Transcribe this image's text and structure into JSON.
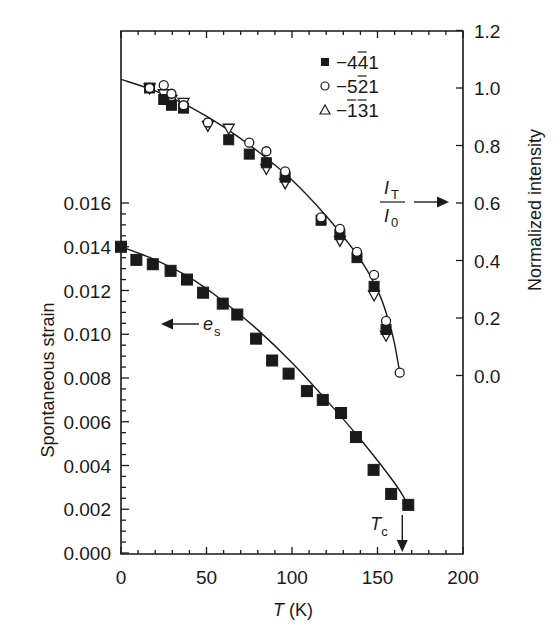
{
  "chart_data": {
    "type": "scatter",
    "title": "",
    "xlabel": "T (K)",
    "xlabel_parts": {
      "var": "T",
      "unit": " (K)"
    },
    "ylabel_left": "Spontaneous strain",
    "ylabel_right": "Normalized intensity",
    "xlim": [
      0,
      200
    ],
    "ylim_left": [
      0,
      0.016
    ],
    "ylim_right": [
      0.0,
      1.2
    ],
    "x_ticks": [
      0,
      50,
      100,
      150,
      200
    ],
    "x_tick_labels": [
      "0",
      "50",
      "100",
      "150",
      "200"
    ],
    "y_left_ticks": [
      0,
      0.002,
      0.004,
      0.006,
      0.008,
      0.01,
      0.012,
      0.014,
      0.016
    ],
    "y_left_tick_labels": [
      "0.000",
      "0.002",
      "0.004",
      "0.006",
      "0.008",
      "0.010",
      "0.012",
      "0.014",
      "0.016"
    ],
    "y_right_ticks": [
      0.0,
      0.2,
      0.4,
      0.6,
      0.8,
      1.0,
      1.2
    ],
    "y_right_tick_labels": [
      "0.0",
      "0.2",
      "0.4",
      "0.6",
      "0.8",
      "1.0",
      "1.2"
    ],
    "grid": false,
    "legend_position": "upper right (inside)",
    "legend": [
      {
        "marker": "filled-square",
        "label": "−441",
        "overbar_index": 2
      },
      {
        "marker": "open-circle",
        "label": "−521",
        "overbar_index": 2
      },
      {
        "marker": "open-triangle",
        "label": "−131",
        "overbar_index": [
          1,
          2
        ]
      }
    ],
    "series": [
      {
        "name": "−4 4̄ 1 (normalized intensity)",
        "axis": "right",
        "marker": "filled-square",
        "x": [
          16.7,
          25,
          29.5,
          36.6,
          63,
          75,
          85,
          96,
          117,
          128,
          138,
          148,
          155
        ],
        "y": [
          1.0,
          0.96,
          0.94,
          0.93,
          0.82,
          0.77,
          0.74,
          0.69,
          0.54,
          0.49,
          0.41,
          0.31,
          0.16
        ]
      },
      {
        "name": "−5 2̄ 1 (normalized intensity)",
        "axis": "right",
        "marker": "open-circle",
        "x": [
          16.7,
          25,
          29.5,
          36.6,
          50.8,
          75,
          85,
          96,
          117,
          128,
          138,
          148,
          155,
          163
        ],
        "y": [
          1.0,
          1.01,
          0.98,
          0.94,
          0.88,
          0.81,
          0.78,
          0.71,
          0.55,
          0.51,
          0.43,
          0.35,
          0.19,
          0.01
        ]
      },
      {
        "name": "−1̄ 3̄ 1 (normalized intensity)",
        "axis": "right",
        "marker": "open-triangle",
        "x": [
          16.7,
          25,
          29.5,
          36.6,
          50.8,
          63,
          85,
          96,
          128,
          148,
          155
        ],
        "y": [
          1.0,
          0.98,
          0.96,
          0.95,
          0.87,
          0.86,
          0.72,
          0.67,
          0.47,
          0.28,
          0.14
        ]
      },
      {
        "name": "e_s (spontaneous strain)",
        "axis": "left",
        "marker": "filled-square",
        "x": [
          0,
          9,
          18.6,
          29,
          38.6,
          48,
          59.5,
          68,
          79,
          88.4,
          98,
          108.7,
          118,
          128.7,
          137.4,
          147.7,
          158,
          168
        ],
        "y": [
          0.014,
          0.0134,
          0.0132,
          0.0129,
          0.0125,
          0.0119,
          0.0114,
          0.0109,
          0.0098,
          0.0088,
          0.0082,
          0.0074,
          0.007,
          0.0064,
          0.0053,
          0.0038,
          0.0027,
          0.0022
        ]
      }
    ],
    "fit_curves": [
      {
        "name": "intensity fit",
        "axis": "right",
        "x": [
          0,
          20,
          40,
          60,
          80,
          100,
          120,
          135,
          145,
          152,
          157,
          160,
          163
        ],
        "y": [
          1.03,
          0.99,
          0.935,
          0.865,
          0.78,
          0.68,
          0.555,
          0.445,
          0.355,
          0.27,
          0.18,
          0.11,
          0.01
        ]
      },
      {
        "name": "strain fit",
        "axis": "left",
        "x": [
          0,
          20,
          40,
          60,
          80,
          100,
          120,
          140,
          160,
          168
        ],
        "y": [
          0.014,
          0.0134,
          0.0126,
          0.0115,
          0.0102,
          0.0087,
          0.007,
          0.0052,
          0.0032,
          0.0022
        ]
      }
    ],
    "annotations": [
      {
        "text": "I_T / I_0",
        "numerator": "I",
        "numerator_sub": "T",
        "denominator": "I",
        "denominator_sub": "0",
        "arrow": "right",
        "points_to": "right axis"
      },
      {
        "text": "e_s",
        "main": "e",
        "sub": "s",
        "arrow": "left",
        "points_to": "left axis"
      },
      {
        "text": "T_c",
        "main": "T",
        "sub": "c",
        "arrow": "down",
        "x": 164.5
      }
    ]
  }
}
